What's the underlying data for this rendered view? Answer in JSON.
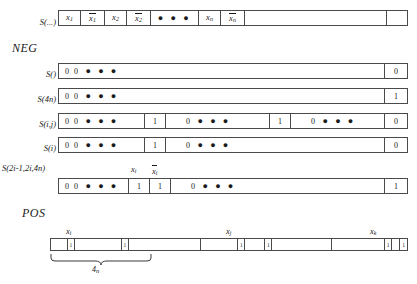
{
  "figure": {
    "sections": [
      {
        "id": "neg",
        "heading": "NEG"
      },
      {
        "id": "pos",
        "heading": "POS"
      }
    ]
  },
  "top_row": {
    "label": "S(...)",
    "cells": [
      {
        "kind": "var",
        "base": "x",
        "sub": "1",
        "bar": false
      },
      {
        "kind": "var",
        "base": "x",
        "sub": "1",
        "bar": true
      },
      {
        "kind": "var",
        "base": "x",
        "sub": "2",
        "bar": false
      },
      {
        "kind": "var",
        "base": "x",
        "sub": "2",
        "bar": true
      },
      {
        "kind": "dots",
        "text": "● ● ●"
      },
      {
        "kind": "var",
        "base": "x",
        "sub": "n",
        "bar": false
      },
      {
        "kind": "var",
        "base": "x",
        "sub": "n",
        "bar": true
      },
      {
        "kind": "empty",
        "text": ""
      },
      {
        "kind": "empty",
        "text": ""
      }
    ]
  },
  "neg_rows": [
    {
      "label": "S()",
      "cells": [
        {
          "text": "0 0",
          "dots": "● ● ●"
        },
        {
          "text": "0",
          "dots": ""
        }
      ]
    },
    {
      "label": "S(4n)",
      "cells": [
        {
          "text": "0 0",
          "dots": "● ● ●"
        },
        {
          "text": "1",
          "dots": ""
        }
      ]
    },
    {
      "label": "S(i,j)",
      "cells": [
        {
          "text": "0 0",
          "dots": "● ● ●"
        },
        {
          "text": "1",
          "dots": ""
        },
        {
          "text": "0",
          "dots": "● ● ●"
        },
        {
          "text": "1",
          "dots": ""
        },
        {
          "text": "0",
          "dots": "● ● ●"
        },
        {
          "text": "0",
          "dots": ""
        }
      ]
    },
    {
      "label": "S(i)",
      "cells": [
        {
          "text": "0 0",
          "dots": "● ● ●"
        },
        {
          "text": "1",
          "dots": ""
        },
        {
          "text": "0",
          "dots": "● ● ●"
        },
        {
          "text": "0",
          "dots": ""
        }
      ]
    },
    {
      "label": "S(2i-1,2i,4n)",
      "cells": [
        {
          "text": "0 0",
          "dots": "● ● ●"
        },
        {
          "text": "1",
          "dots": ""
        },
        {
          "text": "1",
          "dots": ""
        },
        {
          "text": "0",
          "dots": "● ● ●"
        },
        {
          "text": "1",
          "dots": ""
        }
      ],
      "annotations": [
        {
          "base": "x",
          "sub": "i",
          "bar": false
        },
        {
          "base": "x",
          "sub": "i",
          "bar": true
        }
      ]
    }
  ],
  "pos_row": {
    "cells": [
      {
        "text": ""
      },
      {
        "text": "1"
      },
      {
        "text": ""
      },
      {
        "text": "1"
      },
      {
        "text": ""
      },
      {
        "text": ""
      },
      {
        "text": "1"
      },
      {
        "text": ""
      },
      {
        "text": "1"
      },
      {
        "text": ""
      },
      {
        "text": ""
      },
      {
        "text": "1"
      },
      {
        "text": ""
      },
      {
        "text": "1"
      }
    ],
    "annotations": [
      {
        "base": "x",
        "sub": "i"
      },
      {
        "base": "x",
        "sub": "j"
      },
      {
        "base": "x",
        "sub": "k"
      }
    ],
    "brace_label": {
      "base": "4",
      "sub": "n"
    }
  }
}
